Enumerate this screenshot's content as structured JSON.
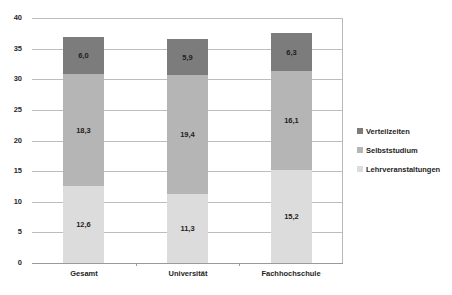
{
  "chart_data": {
    "type": "bar",
    "stacked": true,
    "title": "",
    "xlabel": "",
    "ylabel": "",
    "categories": [
      "Gesamt",
      "Universität",
      "Fachhochschule"
    ],
    "series": [
      {
        "name": "Lehrveranstaltungen",
        "values": [
          12.6,
          11.3,
          15.2
        ],
        "labels": [
          "12,6",
          "11,3",
          "15,2"
        ],
        "color": "#dcdcdc"
      },
      {
        "name": "Selbststudium",
        "values": [
          18.3,
          19.4,
          16.1
        ],
        "labels": [
          "18,3",
          "19,4",
          "16,1"
        ],
        "color": "#b5b5b5"
      },
      {
        "name": "Verteilzeiten",
        "values": [
          6.0,
          5.9,
          6.3
        ],
        "labels": [
          "6,0",
          "5,9",
          "6,3"
        ],
        "color": "#7c7c7c"
      }
    ],
    "ylim": [
      0,
      40
    ],
    "yticks": [
      0,
      5,
      10,
      15,
      20,
      25,
      30,
      35,
      40
    ],
    "ytick_labels": [
      "0",
      "5",
      "10",
      "15",
      "20",
      "25",
      "30",
      "35",
      "40"
    ],
    "grid": true,
    "legend_position": "right",
    "legend_order": [
      "Verteilzeiten",
      "Selbststudium",
      "Lehrveranstaltungen"
    ]
  }
}
